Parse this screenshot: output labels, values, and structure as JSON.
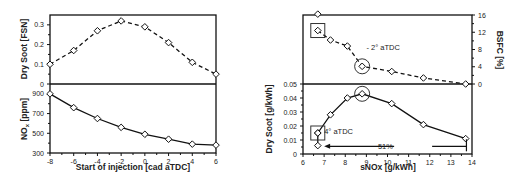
{
  "chart_data": [
    {
      "type": "line",
      "panel": "left",
      "xlabel": "Start of injection [cad aTDC]",
      "x_ticks": [
        -8,
        -6,
        -4,
        -2,
        0,
        2,
        4,
        6
      ],
      "xlim": [
        -8,
        6
      ],
      "subplots": [
        {
          "position": "top",
          "ylabel": "Dry Soot [FSN]",
          "ylim": [
            0,
            0.35
          ],
          "y_ticks": [
            0,
            0.1,
            0.2,
            0.3
          ],
          "y_tick_labels": [
            "0",
            "0.1",
            "0.2",
            "0.3"
          ],
          "series": [
            {
              "name": "Dry Soot",
              "style": "dashed",
              "marker": "diamond",
              "x": [
                -8,
                -6,
                -4,
                -2,
                0,
                2,
                4,
                6
              ],
              "values": [
                0.1,
                0.17,
                0.27,
                0.32,
                0.29,
                0.21,
                0.11,
                0.05
              ]
            }
          ]
        },
        {
          "position": "bottom",
          "ylabel": "NOx [ppm]",
          "ylabel_main": "NO",
          "ylabel_sub": "x",
          "ylabel_rest": " [ppm]",
          "ylim": [
            300,
            1000
          ],
          "y_ticks": [
            300,
            500,
            700,
            900
          ],
          "y_tick_labels": [
            "300",
            "500",
            "700",
            "900"
          ],
          "series": [
            {
              "name": "NOx",
              "style": "solid",
              "marker": "diamond",
              "x": [
                -8,
                -6,
                -4,
                -2,
                0,
                2,
                4,
                6
              ],
              "values": [
                900,
                760,
                650,
                560,
                490,
                440,
                390,
                380
              ]
            }
          ]
        }
      ]
    },
    {
      "type": "line",
      "panel": "right",
      "xlabel": "sNOx [g/kWh]",
      "x_ticks": [
        6,
        7,
        8,
        9,
        10,
        11,
        12,
        13,
        14
      ],
      "xlim": [
        6,
        14
      ],
      "subplots": [
        {
          "position": "top",
          "ylabel": "BSFC [%]",
          "y_axis_side": "right",
          "ylim": [
            0,
            16
          ],
          "y_ticks": [
            0,
            4,
            8,
            12,
            16
          ],
          "y_tick_labels": [
            "0",
            "4",
            "8",
            "12",
            "16"
          ],
          "series": [
            {
              "name": "BSFC",
              "style": "dashed",
              "marker": "diamond",
              "x": [
                6.7,
                7.3,
                8.1,
                8.8,
                10.2,
                11.7,
                13.7
              ],
              "values": [
                12.4,
                10.2,
                8.8,
                4.1,
                2.9,
                1.4,
                0
              ]
            },
            {
              "name": "BSFC extra point",
              "style": "none",
              "marker": "diamond",
              "x": [
                6.7
              ],
              "values": [
                16.2
              ]
            }
          ],
          "annotations": [
            {
              "text": "- 2° aTDC",
              "x": 9.0,
              "y": 8.5
            },
            {
              "shape": "box",
              "x": 6.7,
              "y": 12.4
            },
            {
              "shape": "circle",
              "x": 8.8,
              "y": 4.1
            }
          ]
        },
        {
          "position": "bottom",
          "ylabel": "Dry Soot [g/kWh]",
          "ylim": [
            0,
            0.05
          ],
          "y_ticks": [
            0,
            0.01,
            0.02,
            0.03,
            0.04,
            0.05
          ],
          "y_tick_labels": [
            "0",
            "0.01",
            "0.02",
            "0.03",
            "0.04",
            "0.05"
          ],
          "series": [
            {
              "name": "Dry Soot",
              "style": "solid",
              "marker": "diamond",
              "x": [
                6.7,
                7.3,
                8.1,
                8.8,
                10.2,
                11.7,
                13.7
              ],
              "values": [
                0.015,
                0.028,
                0.04,
                0.043,
                0.036,
                0.021,
                0.011
              ]
            },
            {
              "name": "Dry Soot extra point",
              "style": "solid",
              "marker": "diamond",
              "x": [
                6.7,
                6.7
              ],
              "values": [
                0.015,
                0.006
              ]
            }
          ],
          "annotations": [
            {
              "text": "4° aTDC",
              "x": 7.0,
              "y": 0.016
            },
            {
              "text": "51%",
              "x": 9.9,
              "y": 0.0055
            },
            {
              "shape": "box",
              "x": 6.7,
              "y": 0.015
            },
            {
              "shape": "circle",
              "x": 8.8,
              "y": 0.043
            },
            {
              "shape": "arrow",
              "from_x": 13.5,
              "to_x": 7.0,
              "y": 0.0055
            }
          ]
        }
      ]
    }
  ]
}
